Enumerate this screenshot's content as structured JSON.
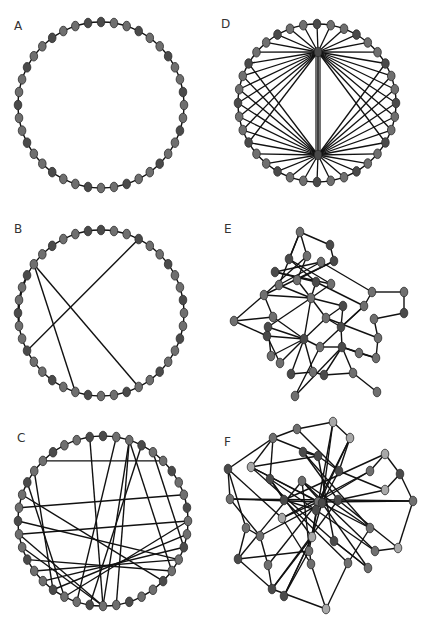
{
  "figure": {
    "width": 431,
    "height": 627,
    "colors": {
      "edge": "#111111",
      "node_fill": "#6f6f6f",
      "node_dark": "#4a4a4a",
      "node_light": "#a8a8a8",
      "node_stroke": "#2a2a2a"
    },
    "panels": [
      {
        "id": "A",
        "label": "A",
        "label_pos": [
          18,
          30
        ],
        "type": "ring",
        "center": [
          101,
          105
        ],
        "radius": 83,
        "nodes": 40,
        "chords": []
      },
      {
        "id": "D",
        "label": "D",
        "label_pos": [
          223,
          30
        ],
        "type": "ring-hubs",
        "center": [
          317,
          103
        ],
        "radius": 79,
        "nodes": 36,
        "hubs": [
          [
            318,
            52
          ],
          [
            318,
            155
          ]
        ],
        "hub_links": "all"
      },
      {
        "id": "B",
        "label": "B",
        "label_pos": [
          16,
          232
        ],
        "type": "ring",
        "center": [
          101,
          313
        ],
        "radius": 83,
        "nodes": 40,
        "chords": [
          [
            34,
            22
          ],
          [
            34,
            17
          ],
          [
            27,
            3
          ],
          [
            33,
            31
          ],
          [
            32,
            30
          ],
          [
            31,
            29
          ]
        ]
      },
      {
        "id": "E",
        "label": "E",
        "label_pos": [
          226,
          232
        ],
        "type": "graph",
        "nodes": [
          [
            300,
            232,
            "m"
          ],
          [
            330,
            245,
            "d"
          ],
          [
            307,
            256,
            "m"
          ],
          [
            289,
            259,
            "d"
          ],
          [
            321,
            262,
            "m"
          ],
          [
            334,
            261,
            "d"
          ],
          [
            275,
            272,
            "d"
          ],
          [
            279,
            285,
            "m"
          ],
          [
            297,
            280,
            "m"
          ],
          [
            316,
            282,
            "d"
          ],
          [
            331,
            284,
            "m"
          ],
          [
            264,
            295,
            "m"
          ],
          [
            311,
            298,
            "m"
          ],
          [
            372,
            292,
            "m"
          ],
          [
            404,
            292,
            "m"
          ],
          [
            343,
            306,
            "d"
          ],
          [
            364,
            306,
            "m"
          ],
          [
            404,
            313,
            "d"
          ],
          [
            234,
            321,
            "m"
          ],
          [
            273,
            317,
            "m"
          ],
          [
            268,
            327,
            "d"
          ],
          [
            326,
            318,
            "m"
          ],
          [
            341,
            327,
            "d"
          ],
          [
            374,
            319,
            "m"
          ],
          [
            267,
            336,
            "d"
          ],
          [
            304,
            339,
            "d"
          ],
          [
            320,
            347,
            "m"
          ],
          [
            378,
            338,
            "m"
          ],
          [
            342,
            347,
            "d"
          ],
          [
            359,
            353,
            "m"
          ],
          [
            271,
            356,
            "m"
          ],
          [
            280,
            363,
            "m"
          ],
          [
            291,
            374,
            "d"
          ],
          [
            313,
            372,
            "m"
          ],
          [
            324,
            375,
            "d"
          ],
          [
            353,
            373,
            "m"
          ],
          [
            376,
            358,
            "m"
          ],
          [
            377,
            392,
            "m"
          ],
          [
            295,
            396,
            "m"
          ]
        ],
        "edges": [
          [
            0,
            1
          ],
          [
            0,
            2
          ],
          [
            0,
            3
          ],
          [
            1,
            5
          ],
          [
            0,
            7
          ],
          [
            2,
            8
          ],
          [
            3,
            9
          ],
          [
            3,
            10
          ],
          [
            4,
            6
          ],
          [
            4,
            7
          ],
          [
            5,
            8
          ],
          [
            5,
            11
          ],
          [
            6,
            9
          ],
          [
            6,
            10
          ],
          [
            7,
            12
          ],
          [
            8,
            12
          ],
          [
            9,
            12
          ],
          [
            10,
            12
          ],
          [
            11,
            12
          ],
          [
            11,
            18
          ],
          [
            11,
            19
          ],
          [
            12,
            20
          ],
          [
            12,
            25
          ],
          [
            12,
            21
          ],
          [
            12,
            15
          ],
          [
            13,
            14
          ],
          [
            13,
            16
          ],
          [
            14,
            17
          ],
          [
            15,
            21
          ],
          [
            15,
            22
          ],
          [
            16,
            22
          ],
          [
            16,
            26
          ],
          [
            17,
            23
          ],
          [
            18,
            24
          ],
          [
            18,
            19
          ],
          [
            19,
            25
          ],
          [
            20,
            25
          ],
          [
            21,
            22
          ],
          [
            21,
            27
          ],
          [
            22,
            28
          ],
          [
            23,
            27
          ],
          [
            24,
            25
          ],
          [
            25,
            26
          ],
          [
            25,
            30
          ],
          [
            25,
            31
          ],
          [
            25,
            32
          ],
          [
            25,
            33
          ],
          [
            25,
            21
          ],
          [
            26,
            28
          ],
          [
            27,
            36
          ],
          [
            28,
            29
          ],
          [
            28,
            35
          ],
          [
            28,
            34
          ],
          [
            29,
            36
          ],
          [
            32,
            33
          ],
          [
            33,
            34
          ],
          [
            34,
            35
          ],
          [
            35,
            37
          ],
          [
            36,
            28
          ],
          [
            31,
            24
          ],
          [
            30,
            20
          ],
          [
            26,
            38
          ],
          [
            38,
            28
          ],
          [
            9,
            16
          ],
          [
            4,
            13
          ],
          [
            2,
            11
          ]
        ]
      },
      {
        "id": "C",
        "label": "C",
        "label_pos": [
          18,
          440
        ],
        "type": "ring",
        "center": [
          103,
          521
        ],
        "radius": 85,
        "nodes": 40,
        "chords": [
          [
            2,
            20
          ],
          [
            1,
            22
          ],
          [
            2,
            14
          ],
          [
            4,
            12
          ],
          [
            35,
            5
          ],
          [
            33,
            23
          ],
          [
            34,
            24
          ],
          [
            32,
            15
          ],
          [
            30,
            13
          ],
          [
            29,
            20
          ],
          [
            28,
            20
          ],
          [
            27,
            14
          ],
          [
            26,
            13
          ],
          [
            25,
            12
          ],
          [
            24,
            11
          ],
          [
            23,
            10
          ],
          [
            31,
            8
          ],
          [
            29,
            10
          ],
          [
            21,
            3
          ],
          [
            19,
            2
          ],
          [
            20,
            39
          ]
        ]
      },
      {
        "id": "F",
        "label": "F",
        "label_pos": [
          226,
          445
        ],
        "type": "graph",
        "nodes": [
          [
            297,
            429,
            "m"
          ],
          [
            333,
            422,
            "l"
          ],
          [
            273,
            438,
            "m"
          ],
          [
            350,
            438,
            "l"
          ],
          [
            303,
            452,
            "d"
          ],
          [
            318,
            456,
            "d"
          ],
          [
            385,
            454,
            "l"
          ],
          [
            251,
            467,
            "l"
          ],
          [
            228,
            469,
            "d"
          ],
          [
            339,
            471,
            "d"
          ],
          [
            370,
            471,
            "m"
          ],
          [
            400,
            474,
            "d"
          ],
          [
            270,
            479,
            "d"
          ],
          [
            302,
            481,
            "m"
          ],
          [
            385,
            490,
            "l"
          ],
          [
            230,
            499,
            "m"
          ],
          [
            284,
            500,
            "d"
          ],
          [
            318,
            502,
            "m"
          ],
          [
            322,
            503,
            "d"
          ],
          [
            338,
            500,
            "d"
          ],
          [
            413,
            501,
            "m"
          ],
          [
            316,
            510,
            "d"
          ],
          [
            282,
            518,
            "l"
          ],
          [
            246,
            528,
            "m"
          ],
          [
            370,
            528,
            "m"
          ],
          [
            260,
            536,
            "m"
          ],
          [
            312,
            537,
            "l"
          ],
          [
            334,
            541,
            "d"
          ],
          [
            309,
            551,
            "m"
          ],
          [
            375,
            551,
            "m"
          ],
          [
            398,
            548,
            "l"
          ],
          [
            238,
            559,
            "d"
          ],
          [
            268,
            565,
            "m"
          ],
          [
            311,
            564,
            "m"
          ],
          [
            348,
            563,
            "m"
          ],
          [
            368,
            568,
            "m"
          ],
          [
            272,
            589,
            "d"
          ],
          [
            284,
            596,
            "d"
          ],
          [
            326,
            609,
            "l"
          ]
        ],
        "edges": [
          [
            0,
            1
          ],
          [
            0,
            2
          ],
          [
            1,
            3
          ],
          [
            1,
            18
          ],
          [
            1,
            26
          ],
          [
            2,
            8
          ],
          [
            2,
            5
          ],
          [
            2,
            12
          ],
          [
            3,
            21
          ],
          [
            3,
            17
          ],
          [
            4,
            5
          ],
          [
            4,
            19
          ],
          [
            4,
            24
          ],
          [
            5,
            9
          ],
          [
            5,
            27
          ],
          [
            6,
            10
          ],
          [
            6,
            11
          ],
          [
            7,
            17
          ],
          [
            7,
            24
          ],
          [
            7,
            27
          ],
          [
            8,
            15
          ],
          [
            8,
            23
          ],
          [
            8,
            22
          ],
          [
            9,
            18
          ],
          [
            9,
            14
          ],
          [
            10,
            17
          ],
          [
            11,
            20
          ],
          [
            11,
            14
          ],
          [
            12,
            16
          ],
          [
            12,
            26
          ],
          [
            13,
            18
          ],
          [
            13,
            29
          ],
          [
            13,
            33
          ],
          [
            14,
            19
          ],
          [
            15,
            17
          ],
          [
            15,
            25
          ],
          [
            16,
            21
          ],
          [
            16,
            34
          ],
          [
            17,
            20
          ],
          [
            17,
            22
          ],
          [
            17,
            28
          ],
          [
            18,
            35
          ],
          [
            18,
            26
          ],
          [
            19,
            20
          ],
          [
            19,
            30
          ],
          [
            20,
            30
          ],
          [
            21,
            29
          ],
          [
            22,
            33
          ],
          [
            23,
            31
          ],
          [
            23,
            25
          ],
          [
            24,
            34
          ],
          [
            25,
            32
          ],
          [
            26,
            36
          ],
          [
            26,
            37
          ],
          [
            27,
            35
          ],
          [
            28,
            37
          ],
          [
            28,
            31
          ],
          [
            29,
            30
          ],
          [
            31,
            36
          ],
          [
            32,
            36
          ],
          [
            33,
            38
          ],
          [
            34,
            38
          ],
          [
            35,
            27
          ],
          [
            36,
            38
          ],
          [
            37,
            26
          ],
          [
            10,
            22
          ],
          [
            6,
            16
          ],
          [
            12,
            21
          ],
          [
            0,
            9
          ],
          [
            2,
            7
          ],
          [
            3,
            9
          ],
          [
            13,
            24
          ],
          [
            15,
            19
          ],
          [
            7,
            5
          ],
          [
            32,
            17
          ],
          [
            31,
            13
          ],
          [
            25,
            18
          ],
          [
            36,
            19
          ]
        ]
      }
    ]
  }
}
